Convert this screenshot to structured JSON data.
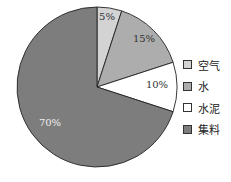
{
  "chart_data": {
    "type": "pie",
    "title": "",
    "start_angle": "12 o'clock, clockwise",
    "slices": [
      {
        "label": "空气",
        "value": 5,
        "display": "5%",
        "color": "#d3d3d3",
        "label_color": "#333333"
      },
      {
        "label": "水",
        "value": 15,
        "display": "15%",
        "color": "#adadad",
        "label_color": "#333333"
      },
      {
        "label": "水泥",
        "value": 10,
        "display": "10%",
        "color": "#ffffff",
        "label_color": "#333333"
      },
      {
        "label": "集料",
        "value": 70,
        "display": "70%",
        "color": "#7d7d7d",
        "label_color": "#eeeeee"
      }
    ],
    "legend": {
      "position": "right",
      "entries": [
        "空气",
        "水",
        "水泥",
        "集料"
      ]
    }
  },
  "legend": {
    "items": [
      {
        "label": "空气",
        "color": "#d3d3d3"
      },
      {
        "label": "水",
        "color": "#adadad"
      },
      {
        "label": "水泥",
        "color": "#ffffff"
      },
      {
        "label": "集料",
        "color": "#7d7d7d"
      }
    ]
  }
}
